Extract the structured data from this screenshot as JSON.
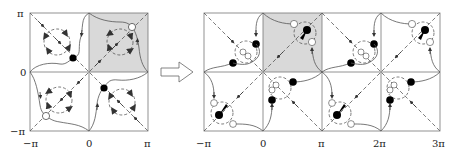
{
  "figure": {
    "shade_color": "#d9d9d9",
    "left_panel": {
      "x_ticks": [
        "−π",
        "0",
        "π"
      ],
      "y_ticks": [
        "π",
        "0",
        "−π"
      ],
      "shaded_cell": "top-right",
      "cells": [
        {
          "position": "top-left",
          "fixed_point": "filled",
          "vortex": "dashed circle with 4 arrows"
        },
        {
          "position": "top-right",
          "fixed_point": "open",
          "vortex": "dashed circle with 4 arrows",
          "shaded": true
        },
        {
          "position": "bottom-left",
          "fixed_point": "open",
          "vortex": "dashed circle with 4 arrows"
        },
        {
          "position": "bottom-right",
          "fixed_point": "filled",
          "vortex": "dashed circle with 4 arrows"
        }
      ]
    },
    "transition_arrow": "hollow-right-arrow",
    "right_panel": {
      "x_ticks": [
        "−π",
        "0",
        "π",
        "2π",
        "3π"
      ],
      "y_ticks": [
        "π",
        "0",
        "−π"
      ],
      "shaded_cell": "column 2, top row",
      "columns": 4,
      "rows": 2
    }
  }
}
